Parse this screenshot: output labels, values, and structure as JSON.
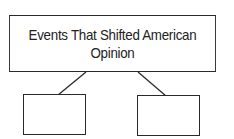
{
  "diagram": {
    "title": "Events That Shifted American Opinion",
    "children": [
      {
        "label": ""
      },
      {
        "label": ""
      }
    ],
    "colors": {
      "stroke": "#2a2a2a",
      "background": "#ffffff"
    }
  }
}
